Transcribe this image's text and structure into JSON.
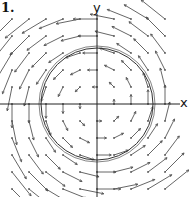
{
  "figure": {
    "number_label": "1.",
    "x_axis_label": "x",
    "y_axis_label": "y"
  },
  "geometry": {
    "origin": [
      97,
      104
    ],
    "grid_spacing": 17,
    "grid_range": [
      -5,
      5
    ],
    "arrow_scale": 0.28,
    "circles": [
      {
        "r": 56,
        "style": "double"
      }
    ]
  },
  "colors": {
    "axis": "#222222",
    "arrow": "#555555",
    "curve": "#333333",
    "text": "#111111"
  }
}
